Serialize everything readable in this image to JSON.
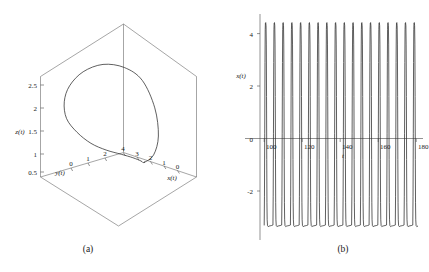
{
  "figure": {
    "background_color": "#ffffff",
    "line_color": "#2b2b2b",
    "axis_color": "#4a4a4a",
    "box_color": "#6a6a6a"
  },
  "panels": [
    {
      "caption": "(a)",
      "type": "phase-space-3d"
    },
    {
      "caption": "(b)",
      "type": "time-series"
    }
  ],
  "chart_data": [
    {
      "type": "line",
      "title": "",
      "panel": "(a)",
      "projection": "3d",
      "xlabel": "x(t)",
      "ylabel": "y(t)",
      "zlabel": "z(t)",
      "xlim": [
        0,
        4
      ],
      "ylim": [
        0,
        2
      ],
      "zlim": [
        0,
        3
      ],
      "xticks": [
        4,
        3,
        2,
        1,
        0
      ],
      "yticks": [
        0,
        1,
        2
      ],
      "zticks": [
        0.5,
        1,
        1.5,
        2,
        2.5
      ],
      "grid": false,
      "legend": "none",
      "description": "Closed dome-shaped limit-cycle trajectory plotted inside a 3D bounding box",
      "series": [
        {
          "name": "trajectory",
          "x": [
            2.0,
            2.6,
            3.2,
            3.7,
            4.0,
            3.9,
            3.4,
            2.7,
            2.0,
            1.3,
            0.7,
            0.25,
            0.05,
            0.1,
            0.45,
            1.0,
            1.6,
            2.0
          ],
          "y": [
            0.15,
            0.12,
            0.2,
            0.45,
            0.85,
            1.25,
            1.6,
            1.85,
            1.95,
            1.85,
            1.6,
            1.2,
            0.8,
            0.45,
            0.2,
            0.1,
            0.1,
            0.15
          ],
          "z": [
            0.1,
            0.35,
            0.9,
            1.7,
            2.5,
            2.9,
            3.0,
            2.8,
            2.4,
            1.9,
            1.35,
            0.85,
            0.45,
            0.2,
            0.08,
            0.05,
            0.06,
            0.1
          ]
        }
      ]
    },
    {
      "type": "line",
      "title": "",
      "panel": "(b)",
      "xlabel": "t",
      "ylabel": "x(t)",
      "xlim": [
        98,
        182
      ],
      "ylim": [
        -3.6,
        4.6
      ],
      "xticks": [
        100,
        120,
        140,
        160,
        180
      ],
      "yticks": [
        4,
        2,
        0,
        -2
      ],
      "grid": false,
      "legend": "none",
      "description": "Relaxation oscillation of x(t) versus t: sharp narrow upward spikes to about 4.4 and slow troughs near -3.3, period about 4.6 time units",
      "waveform": {
        "t_start": 100.0,
        "t_end": 181.0,
        "period": 4.6,
        "peak_value": 4.4,
        "trough_value": -3.3,
        "n_cycles": 17.6,
        "shape": "relaxation-spike"
      }
    }
  ]
}
